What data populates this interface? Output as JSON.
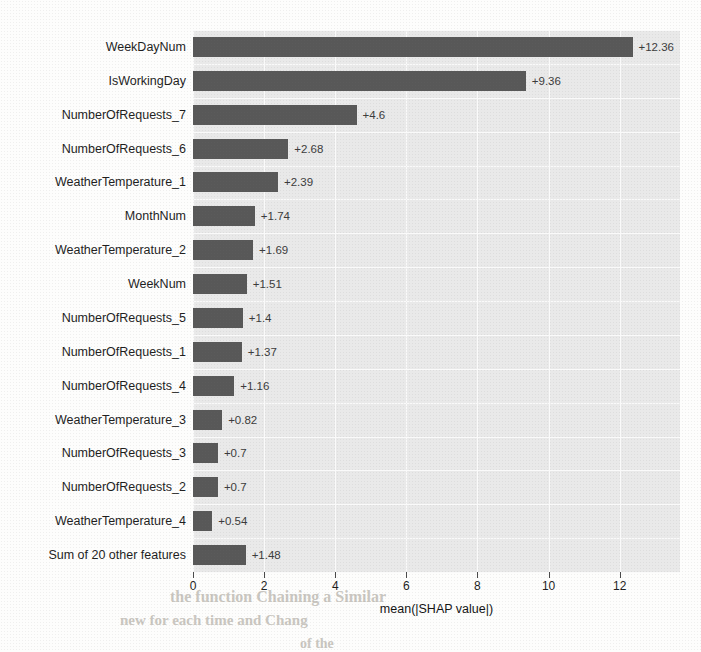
{
  "chart_data": {
    "type": "bar",
    "orientation": "horizontal",
    "title": "",
    "xlabel": "mean(|SHAP value|)",
    "ylabel": "",
    "xlim": [
      0,
      13.5
    ],
    "xticks": [
      0,
      2,
      4,
      6,
      8,
      10,
      12
    ],
    "xtick_labels": [
      "0",
      "2",
      "4",
      "6",
      "8",
      "10",
      "12"
    ],
    "grid": true,
    "legend": null,
    "bar_color": "#585858",
    "panel_color": "#e9e9e9",
    "gridline_color": "#fafafa",
    "categories": [
      "WeekDayNum",
      "IsWorkingDay",
      "NumberOfRequests_7",
      "NumberOfRequests_6",
      "WeatherTemperature_1",
      "MonthNum",
      "WeatherTemperature_2",
      "WeekNum",
      "NumberOfRequests_5",
      "NumberOfRequests_1",
      "NumberOfRequests_4",
      "WeatherTemperature_3",
      "NumberOfRequests_3",
      "NumberOfRequests_2",
      "WeatherTemperature_4",
      "Sum of 20 other features"
    ],
    "values": [
      12.36,
      9.36,
      4.6,
      2.68,
      2.39,
      1.74,
      1.69,
      1.51,
      1.4,
      1.37,
      1.16,
      0.82,
      0.7,
      0.7,
      0.54,
      1.48
    ],
    "data_labels": [
      "+12.36",
      "+9.36",
      "+4.6",
      "+2.68",
      "+2.39",
      "+1.74",
      "+1.69",
      "+1.51",
      "+1.4",
      "+1.37",
      "+1.16",
      "+0.82",
      "+0.7",
      "+0.7",
      "+0.54",
      "+1.48"
    ]
  },
  "bleed_text": [
    {
      "text": "SHAP values for each feature",
      "x": 238,
      "y": 372,
      "size": 15
    },
    {
      "text": "the function Chaining a Similar",
      "x": 170,
      "y": 588,
      "size": 16
    },
    {
      "text": "new for each time and Chang",
      "x": 120,
      "y": 612,
      "size": 15
    },
    {
      "text": "of the",
      "x": 300,
      "y": 636,
      "size": 14
    }
  ]
}
